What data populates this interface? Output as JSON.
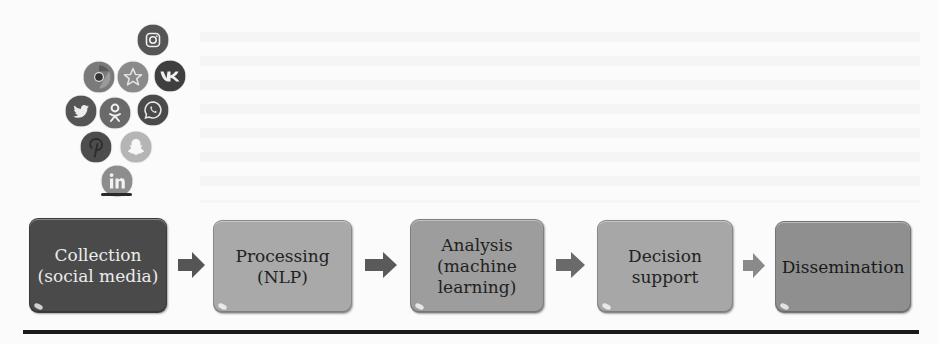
{
  "figure": {
    "icons": [
      {
        "name": "instagram-icon",
        "label": "Instagram",
        "fill": "#555555"
      },
      {
        "name": "chrome-icon",
        "label": "Chrome",
        "fill": "#7a7a7a"
      },
      {
        "name": "star-icon",
        "label": "Star",
        "fill": "#8a8a8a"
      },
      {
        "name": "vk-icon",
        "label": "VK",
        "fill": "#3f3f3f"
      },
      {
        "name": "twitter-icon",
        "label": "Twitter",
        "fill": "#555555"
      },
      {
        "name": "odnoklassniki-icon",
        "label": "Odnoklassniki",
        "fill": "#6a6a6a"
      },
      {
        "name": "whatsapp-icon",
        "label": "WhatsApp",
        "fill": "#4a4a4a"
      },
      {
        "name": "pinterest-icon",
        "label": "Pinterest",
        "fill": "#4d4d4d"
      },
      {
        "name": "snapchat-icon",
        "label": "Snapchat",
        "fill": "#b5b5b5"
      },
      {
        "name": "linkedin-icon",
        "label": "LinkedIn",
        "fill": "#8d8d8d"
      }
    ],
    "steps": [
      {
        "label": "Collection\n(social media)",
        "bg": "#4a4a4a",
        "text_color": "#ececec"
      },
      {
        "label": "Processing\n(NLP)",
        "bg": "#a9a9a9",
        "text_color": "#222222"
      },
      {
        "label": "Analysis\n(machine\nlearning)",
        "bg": "#9d9d9d",
        "text_color": "#222222"
      },
      {
        "label": "Decision\nsupport",
        "bg": "#a7a7a7",
        "text_color": "#222222"
      },
      {
        "label": "Dissemination",
        "bg": "#8f8f8f",
        "text_color": "#1a1a1a"
      }
    ],
    "arrow_colors": [
      "#555555",
      "#5a5a5a",
      "#6a6a6a",
      "#8a8a8a"
    ],
    "rule_color": "#1a1a1a"
  }
}
